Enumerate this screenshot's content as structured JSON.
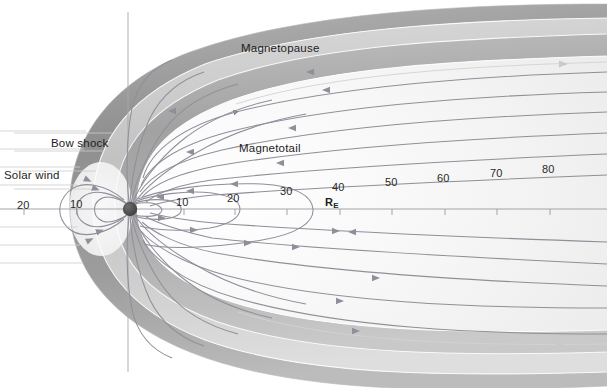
{
  "figure": {
    "type": "scientific-diagram",
    "background_color": "#ffffff",
    "ink_color": "#1d1d1d"
  },
  "labels": {
    "magnetopause": "Magnetopause",
    "magnetotail": "Magnetotail",
    "bow_shock": "Bow shock",
    "solar_wind": "Solar wind",
    "earth_radii_unit": "R",
    "earth_radii_sub": "E"
  },
  "axis": {
    "unit": "R_E",
    "orientation": "horizontal",
    "sunward_ticks": [
      "20",
      "10"
    ],
    "tailward_ticks": [
      "10",
      "20",
      "30",
      "40",
      "50",
      "60",
      "70",
      "80"
    ],
    "tick_values_sunward": [
      20,
      10
    ],
    "tick_values_tailward": [
      10,
      20,
      30,
      40,
      50,
      60,
      70,
      80
    ]
  },
  "regions": [
    {
      "name": "solar-wind",
      "shade": "#ffffff"
    },
    {
      "name": "bow-shock-band",
      "shade": "#9b9b9b"
    },
    {
      "name": "magnetosheath",
      "shade": "#c6c6c6"
    },
    {
      "name": "magnetopause-band",
      "shade": "#a5a5a5"
    },
    {
      "name": "magnetosphere-interior",
      "shade": "#f2f2f2"
    },
    {
      "name": "plasma-sheet",
      "shade": "#ededed"
    }
  ],
  "earth": {
    "name": "Earth",
    "color": "#4a4a4a",
    "cx": 130,
    "cy": 209,
    "r": 7
  },
  "field_lines": {
    "color": "#8b8b96",
    "arrow_color": "#8b8b96",
    "inbound_direction": "toward-earth",
    "outbound_direction": "tailward"
  }
}
